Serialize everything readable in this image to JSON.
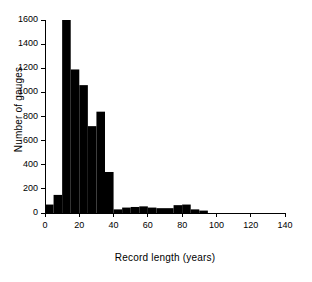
{
  "chart_data": {
    "type": "bar",
    "title": "",
    "subtitle": "",
    "xlabel": "Record length (years)",
    "ylabel": "Number of gauges",
    "xlim": [
      0,
      140
    ],
    "ylim": [
      0,
      1600
    ],
    "xticks": [
      0,
      20,
      40,
      60,
      80,
      100,
      120,
      140
    ],
    "yticks": [
      0,
      200,
      400,
      600,
      800,
      1000,
      1200,
      1400,
      1600
    ],
    "grid": false,
    "legend": null,
    "bin_width": 5,
    "bar_color": "#000000",
    "axis_color": "#000000",
    "bin_edges": [
      0,
      5,
      10,
      15,
      20,
      25,
      30,
      35,
      40,
      45,
      50,
      55,
      60,
      65,
      70,
      75,
      80,
      85,
      90,
      95
    ],
    "values": [
      70,
      150,
      1600,
      1190,
      1060,
      720,
      840,
      340,
      30,
      45,
      50,
      55,
      45,
      40,
      40,
      65,
      70,
      30,
      20
    ],
    "annotations": []
  }
}
